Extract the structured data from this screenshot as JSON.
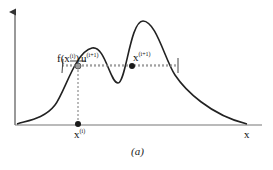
{
  "diagram": {
    "caption": "(a)",
    "axis": {
      "x_label": "x"
    },
    "labels": {
      "f_value": "f(x",
      "f_value_sup": "(i)",
      "f_value_close": ")",
      "u": "u",
      "u_sup": "(i+1)",
      "x_next": "x",
      "x_next_sup": "(i+1)",
      "x_current": "x",
      "x_current_sup": "(i)"
    },
    "colors": {
      "curve": "#222222",
      "axis": "#555555",
      "dashed": "#777777",
      "point_dark": "#1a1a1a",
      "point_gray": "#888888"
    }
  }
}
